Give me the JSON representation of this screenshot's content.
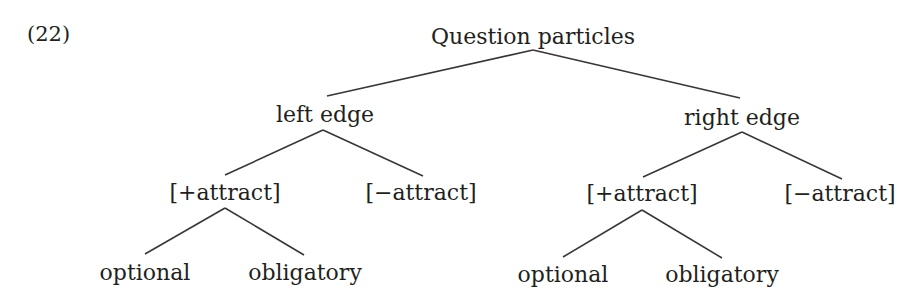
{
  "example_number": "(22)",
  "tree": {
    "root": "Question particles",
    "left": {
      "label": "left edge",
      "plus": {
        "label": "[+attract]",
        "children": [
          "optional",
          "obligatory"
        ]
      },
      "minus": {
        "label": "[−attract]"
      }
    },
    "right": {
      "label": "right edge",
      "plus": {
        "label": "[+attract]",
        "children": [
          "optional",
          "obligatory"
        ]
      },
      "minus": {
        "label": "[−attract]"
      }
    }
  },
  "colors": {
    "text": "#231f20",
    "line": "#3a3637",
    "background": "#ffffff"
  }
}
